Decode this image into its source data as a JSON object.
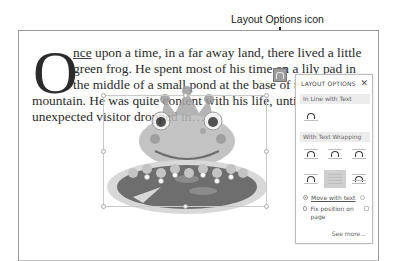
{
  "callout": {
    "label": "Layout Options icon"
  },
  "document": {
    "dropcap": "O",
    "lines": [
      {
        "pre": "nce",
        "text": " upon a time, in a far away land, there lived a little"
      },
      {
        "text": "green frog. He spent most of his time on a lily pad in"
      },
      {
        "text": "the middle of a small pond at the base of the"
      },
      {
        "text": "mountain. He was quite content with his life, until the"
      },
      {
        "text": "unexpected visitor dropped in…"
      }
    ],
    "image_alt": "frog-on-lily-pad-illustration"
  },
  "layout_options": {
    "title": "LAYOUT OPTIONS",
    "close_glyph": "✕",
    "inline_section": "In Line with Text",
    "wrapping_section": "With Text Wrapping",
    "inline_options": [
      {
        "name": "in-line-with-text"
      }
    ],
    "wrap_options": [
      {
        "name": "square"
      },
      {
        "name": "tight"
      },
      {
        "name": "through"
      },
      {
        "name": "top-and-bottom"
      },
      {
        "name": "behind-text",
        "selected": true
      },
      {
        "name": "in-front-of-text"
      }
    ],
    "radio_options": [
      {
        "label": "Move with text",
        "checked": true
      },
      {
        "label": "Fix position on page",
        "checked": false
      }
    ],
    "see_more": "See more..."
  }
}
